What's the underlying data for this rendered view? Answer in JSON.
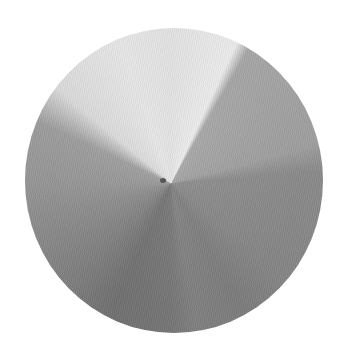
{
  "image": {
    "subject": "circular paper disc with radial gray value segments",
    "palette": {
      "background": "#ffffff",
      "lightest_segment": "#e6e6e6",
      "light_gray_segment": "#a0a0a0",
      "mid_gray_segment": "#858585",
      "dark_gray_segment": "#707070"
    }
  }
}
